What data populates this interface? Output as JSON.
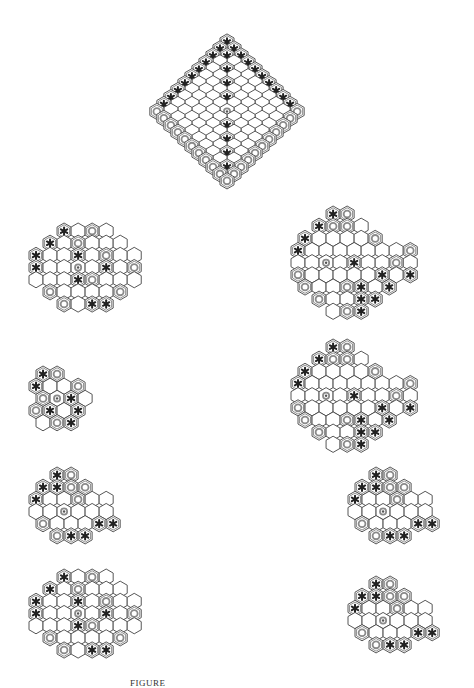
{
  "figure": {
    "caption": "FIGURE"
  },
  "colors": {
    "hex_stroke": "#444444",
    "ring_stroke": "#8a8a8a",
    "star_fill": "#222222",
    "center_dot": "#555555",
    "background": "#ffffff"
  },
  "legend": {
    "star": "black-piece (asterisk)",
    "ring": "white-piece (ring)",
    "dot": "center-marker"
  },
  "boards": [
    {
      "id": "main-rhombus",
      "x": 100,
      "y": 34,
      "size": 8.1,
      "shape": "rhombus",
      "n": 11,
      "stars": [
        [
          0,
          0
        ],
        [
          0,
          1
        ],
        [
          0,
          2
        ],
        [
          0,
          3
        ],
        [
          0,
          4
        ],
        [
          0,
          5
        ],
        [
          0,
          6
        ],
        [
          0,
          7
        ],
        [
          0,
          8
        ],
        [
          0,
          9
        ],
        [
          0,
          10
        ],
        [
          1,
          1
        ],
        [
          2,
          2
        ],
        [
          3,
          3
        ],
        [
          4,
          4
        ],
        [
          5,
          5
        ],
        [
          6,
          6
        ],
        [
          7,
          7
        ],
        [
          8,
          8
        ],
        [
          9,
          9
        ],
        [
          10,
          10
        ],
        [
          10,
          0
        ],
        [
          10,
          1
        ],
        [
          10,
          2
        ],
        [
          10,
          3
        ],
        [
          10,
          4
        ],
        [
          10,
          5
        ],
        [
          10,
          6
        ],
        [
          10,
          7
        ],
        [
          10,
          8
        ],
        [
          10,
          9
        ],
        [
          1,
          0
        ],
        [
          5,
          7
        ],
        [
          6,
          7
        ]
      ],
      "rings": [
        [
          0,
          10
        ],
        [
          1,
          10
        ],
        [
          2,
          10
        ],
        [
          3,
          10
        ],
        [
          4,
          10
        ],
        [
          5,
          10
        ],
        [
          6,
          10
        ],
        [
          7,
          10
        ],
        [
          8,
          10
        ],
        [
          9,
          10
        ],
        [
          10,
          10
        ],
        [
          1,
          0
        ],
        [
          2,
          0
        ],
        [
          3,
          0
        ],
        [
          4,
          0
        ],
        [
          5,
          0
        ],
        [
          6,
          0
        ],
        [
          7,
          0
        ],
        [
          8,
          0
        ],
        [
          9,
          0
        ],
        [
          3,
          7
        ],
        [
          2,
          1
        ],
        [
          6,
          8
        ],
        [
          8,
          5
        ]
      ],
      "dots": [
        [
          5,
          5
        ]
      ]
    },
    {
      "id": "left-1",
      "x": 28,
      "y": 222,
      "size": 8.1,
      "shape": "hexlike"
    },
    {
      "id": "right-1",
      "x": 290,
      "y": 205,
      "size": 8.1,
      "shape": "hexlike-large"
    },
    {
      "id": "left-2",
      "x": 28,
      "y": 365,
      "size": 8.1,
      "shape": "small"
    },
    {
      "id": "right-2",
      "x": 290,
      "y": 338,
      "size": 8.1,
      "shape": "hexlike-large"
    },
    {
      "id": "left-3",
      "x": 28,
      "y": 466,
      "size": 8.1,
      "shape": "medium"
    },
    {
      "id": "right-3",
      "x": 347,
      "y": 466,
      "size": 8.1,
      "shape": "medium"
    },
    {
      "id": "left-4",
      "x": 28,
      "y": 568,
      "size": 8.1,
      "shape": "hexlike"
    },
    {
      "id": "right-4",
      "x": 347,
      "y": 575,
      "size": 8.1,
      "shape": "medium"
    }
  ]
}
